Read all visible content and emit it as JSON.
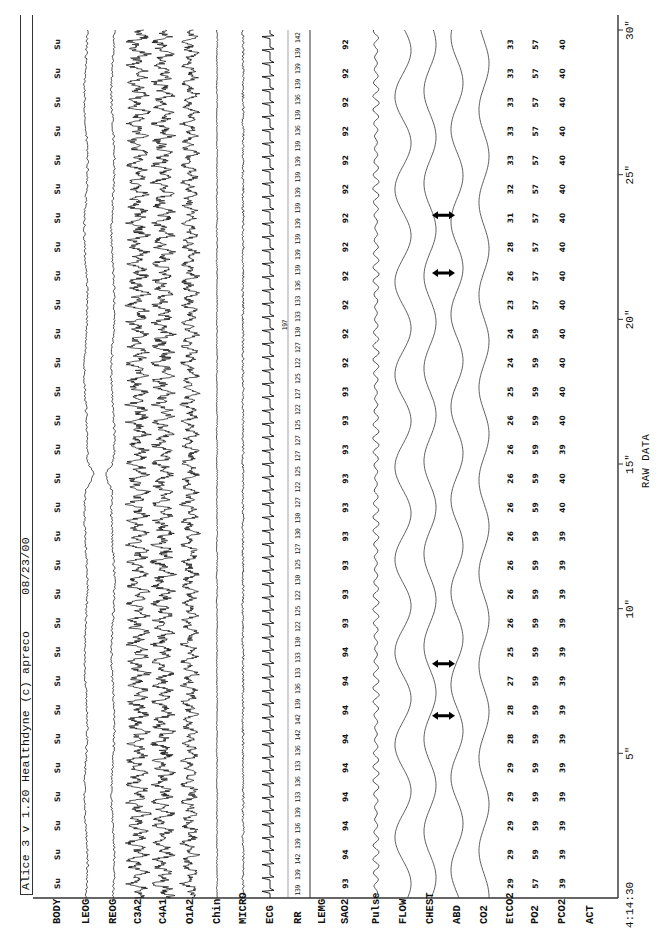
{
  "header": {
    "title": "Alice 3 v 1.20 Healthdyne (c) apreco     08/23/00"
  },
  "footer": {
    "label": "RAW DATA"
  },
  "time_axis": {
    "start": "4:14:30",
    "ticks": [
      {
        "sec": 5,
        "label": "5\""
      },
      {
        "sec": 10,
        "label": "10\""
      },
      {
        "sec": 15,
        "label": "15\""
      },
      {
        "sec": 20,
        "label": "20\""
      },
      {
        "sec": 25,
        "label": "25\""
      },
      {
        "sec": 30,
        "label": "30\""
      }
    ]
  },
  "channels": [
    {
      "key": "body",
      "label": "BODY",
      "y": 57
    },
    {
      "key": "leog",
      "label": "LEOG",
      "y": 86
    },
    {
      "key": "reog",
      "label": "REOG",
      "y": 113
    },
    {
      "key": "c3a2",
      "label": "C3A2",
      "y": 138
    },
    {
      "key": "c4a1",
      "label": "C4A1",
      "y": 163
    },
    {
      "key": "o1a2",
      "label": "O1A2",
      "y": 190
    },
    {
      "key": "chin",
      "label": "Chin",
      "y": 217
    },
    {
      "key": "micro",
      "label": "MICRO",
      "y": 243
    },
    {
      "key": "ecg",
      "label": "ECG",
      "y": 270
    },
    {
      "key": "rr",
      "label": "RR",
      "y": 298
    },
    {
      "key": "lemg",
      "label": "LEMG",
      "y": 322
    },
    {
      "key": "sao2",
      "label": "SAO2",
      "y": 345
    },
    {
      "key": "pulse",
      "label": "Pulse",
      "y": 376
    },
    {
      "key": "flow",
      "label": "FLOW",
      "y": 403
    },
    {
      "key": "chest",
      "label": "CHEST",
      "y": 430
    },
    {
      "key": "abd",
      "label": "ABD",
      "y": 457
    },
    {
      "key": "co2",
      "label": "CO2",
      "y": 484
    },
    {
      "key": "etco2",
      "label": "EtCO2",
      "y": 510
    },
    {
      "key": "po2",
      "label": "PO2",
      "y": 535
    },
    {
      "key": "pco2",
      "label": "PCO2",
      "y": 562
    },
    {
      "key": "act",
      "label": "ACT",
      "y": 590
    }
  ],
  "body_position": "Su",
  "rr_extra_annotation": "197",
  "chart_data": {
    "type": "line",
    "title": "Alice 3 v 1.20 Healthdyne (c) apreco 08/23/00",
    "subtitle": "RAW DATA",
    "xlabel": "Time (s) from 4:14:30",
    "x_ticks": [
      "4:14:30",
      "5\"",
      "10\"",
      "15\"",
      "20\"",
      "25\"",
      "30\""
    ],
    "xlim": [
      0,
      30
    ],
    "grid": false,
    "orientation": "page rotated 90 degrees counter-clockwise",
    "channels": [
      "BODY",
      "LEOG",
      "REOG",
      "C3A2",
      "C4A1",
      "O1A2",
      "Chin",
      "MICRO",
      "ECG",
      "RR",
      "LEMG",
      "SAO2",
      "Pulse",
      "FLOW",
      "CHEST",
      "ABD",
      "CO2",
      "EtCO2",
      "PO2",
      "PCO2",
      "ACT"
    ],
    "epoch_seconds": [
      0,
      1,
      2,
      3,
      4,
      5,
      6,
      7,
      8,
      9,
      10,
      11,
      12,
      13,
      14,
      15,
      16,
      17,
      18,
      19,
      20,
      21,
      22,
      23,
      24,
      25,
      26,
      27,
      28,
      29
    ],
    "series": [
      {
        "name": "BODY",
        "values": [
          "Su",
          "Su",
          "Su",
          "Su",
          "Su",
          "Su",
          "Su",
          "Su",
          "Su",
          "Su",
          "Su",
          "Su",
          "Su",
          "Su",
          "Su",
          "Su",
          "Su",
          "Su",
          "Su",
          "Su",
          "Su",
          "Su",
          "Su",
          "Su",
          "Su",
          "Su",
          "Su",
          "Su",
          "Su",
          "Su"
        ]
      },
      {
        "name": "SAO2",
        "values": [
          93,
          94,
          94,
          94,
          94,
          94,
          94,
          94,
          94,
          93,
          93,
          93,
          93,
          93,
          93,
          93,
          93,
          93,
          92,
          92,
          92,
          92,
          92,
          92,
          92,
          92,
          92,
          92,
          92,
          92
        ]
      },
      {
        "name": "EtCO2",
        "values": [
          29,
          29,
          29,
          29,
          29,
          28,
          28,
          27,
          25,
          26,
          26,
          26,
          26,
          26,
          26,
          26,
          26,
          25,
          24,
          24,
          23,
          26,
          28,
          31,
          32,
          33,
          33,
          33,
          33,
          33
        ]
      },
      {
        "name": "PO2",
        "values": [
          57,
          59,
          59,
          59,
          59,
          59,
          59,
          59,
          59,
          59,
          59,
          59,
          59,
          59,
          59,
          59,
          59,
          59,
          59,
          59,
          57,
          57,
          57,
          57,
          57,
          57,
          57,
          57,
          57,
          57
        ]
      },
      {
        "name": "PCO2",
        "values": [
          39,
          39,
          39,
          39,
          39,
          39,
          39,
          39,
          39,
          39,
          39,
          39,
          39,
          40,
          40,
          39,
          40,
          40,
          40,
          40,
          40,
          40,
          40,
          40,
          40,
          40,
          40,
          40,
          40,
          40
        ]
      },
      {
        "name": "RR",
        "values": [
          139,
          139,
          142,
          139,
          136,
          139,
          133,
          136,
          133,
          136,
          142,
          142,
          139,
          136,
          133,
          133,
          130,
          122,
          125,
          122,
          130,
          125,
          127,
          130,
          130,
          127,
          122,
          125,
          127,
          127,
          125,
          122,
          127,
          125,
          122,
          127,
          130,
          133,
          133,
          136,
          139,
          139,
          139,
          139,
          139,
          139,
          139,
          139,
          139,
          136,
          139,
          136,
          139,
          139,
          139,
          142
        ]
      },
      {
        "name": "CHEST-ABD paradox markers",
        "values": [
          6.3,
          8.1,
          21.6,
          23.6
        ]
      }
    ]
  }
}
